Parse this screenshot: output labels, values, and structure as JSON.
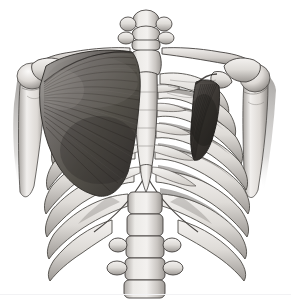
{
  "figure": {
    "title": "Anterior view of the human thorax",
    "subtitle": "Rib cage, vertebral column, shoulder girdle and chest muscles",
    "style": "grayscale medical illustration",
    "view": "anterior",
    "background_color": "#ffffff",
    "baseline_color": "#f2f2f4",
    "palette": {
      "bone_light": "#f0eeec",
      "bone_mid": "#d6d3cf",
      "bone_shadow": "#a9a5a1",
      "bone_deep_shadow": "#7b7773",
      "outline": "#3c3a38",
      "muscle_light": "#8e8b88",
      "muscle_mid": "#6a6663",
      "muscle_dark": "#46433f",
      "muscle_deepest": "#2e2c29",
      "cartilage": "#e6e3df"
    }
  },
  "structures": [
    {
      "id": "cervical-vertebrae",
      "label": "Cervical vertebrae",
      "side": "midline",
      "tissue": "bone",
      "description": "Stack of small vertebrae at top center with lateral transverse processes"
    },
    {
      "id": "manubrium",
      "label": "Manubrium of sternum",
      "side": "midline",
      "tissue": "bone",
      "description": "Broad upper sternum where both clavicles articulate"
    },
    {
      "id": "sternum-body",
      "label": "Body of sternum",
      "side": "midline",
      "tissue": "bone",
      "description": "Long flat midline plate with segmented sternebrae"
    },
    {
      "id": "xiphoid-process",
      "label": "Xiphoid process",
      "side": "midline",
      "tissue": "bone",
      "description": "Tapered inferior tip of sternum at the infrasternal angle"
    },
    {
      "id": "clavicle-left",
      "label": "Left clavicle",
      "side": "left",
      "tissue": "bone",
      "description": "S-curved collarbone running from manubrium to acromion"
    },
    {
      "id": "clavicle-right",
      "label": "Right clavicle",
      "side": "right",
      "tissue": "bone",
      "description": "S-curved collarbone running from manubrium to acromion"
    },
    {
      "id": "acromion-left",
      "label": "Left acromion",
      "side": "left",
      "tissue": "bone",
      "description": "Flat lateral process of scapula capping the shoulder"
    },
    {
      "id": "acromion-right",
      "label": "Right acromion",
      "side": "right",
      "tissue": "bone",
      "description": "Flat lateral process of scapula capping the shoulder"
    },
    {
      "id": "coracoid-right",
      "label": "Right coracoid process",
      "side": "right",
      "tissue": "bone",
      "description": "Hook-like process giving origin to pectoralis minor"
    },
    {
      "id": "humerus-left",
      "label": "Left humerus",
      "side": "left",
      "tissue": "bone",
      "description": "Rounded head in glenoid with shaft descending laterally"
    },
    {
      "id": "humerus-right",
      "label": "Right humerus",
      "side": "right",
      "tissue": "bone",
      "description": "Rounded head in glenoid with shaft descending laterally"
    },
    {
      "id": "ribs-left",
      "label": "Left ribs",
      "side": "left",
      "tissue": "bone",
      "description": "Curved ribs partly hidden behind pectoralis major"
    },
    {
      "id": "ribs-right",
      "label": "Right ribs",
      "side": "right",
      "tissue": "bone",
      "description": "Seven true ribs plus false ribs, fully exposed"
    },
    {
      "id": "costal-cartilage",
      "label": "Costal cartilages",
      "side": "bilateral",
      "tissue": "cartilage",
      "description": "Pale bands joining anterior rib ends to the sternum"
    },
    {
      "id": "costal-margin",
      "label": "Costal margin",
      "side": "bilateral",
      "tissue": "cartilage",
      "description": "Lower border of the rib cage forming the subcostal arch"
    },
    {
      "id": "lumbar-vertebrae",
      "label": "Lumbar vertebrae",
      "side": "midline",
      "tissue": "bone",
      "description": "Large vertebral bodies with wing-like transverse processes at bottom"
    },
    {
      "id": "pectoralis-major-left",
      "label": "Pectoralis major (left)",
      "side": "left",
      "tissue": "muscle",
      "description": "Large fan-shaped chest muscle with fibers radiating from sternum and clavicle converging to the humerus"
    },
    {
      "id": "pectoralis-minor-right",
      "label": "Pectoralis minor (right)",
      "side": "right",
      "tissue": "muscle",
      "description": "Deep triangular muscle from ribs 3-5 to the coracoid process, exposed after removal of pectoralis major"
    },
    {
      "id": "intercostal-muscles",
      "label": "Intercostal muscles",
      "side": "bilateral",
      "tissue": "muscle",
      "description": "Dark striated sheets filling the spaces between ribs"
    },
    {
      "id": "deltoid-shadow-left",
      "label": "Deltoid region (left)",
      "side": "left",
      "tissue": "muscle",
      "description": "Shaded mass over the lateral shoulder"
    }
  ]
}
